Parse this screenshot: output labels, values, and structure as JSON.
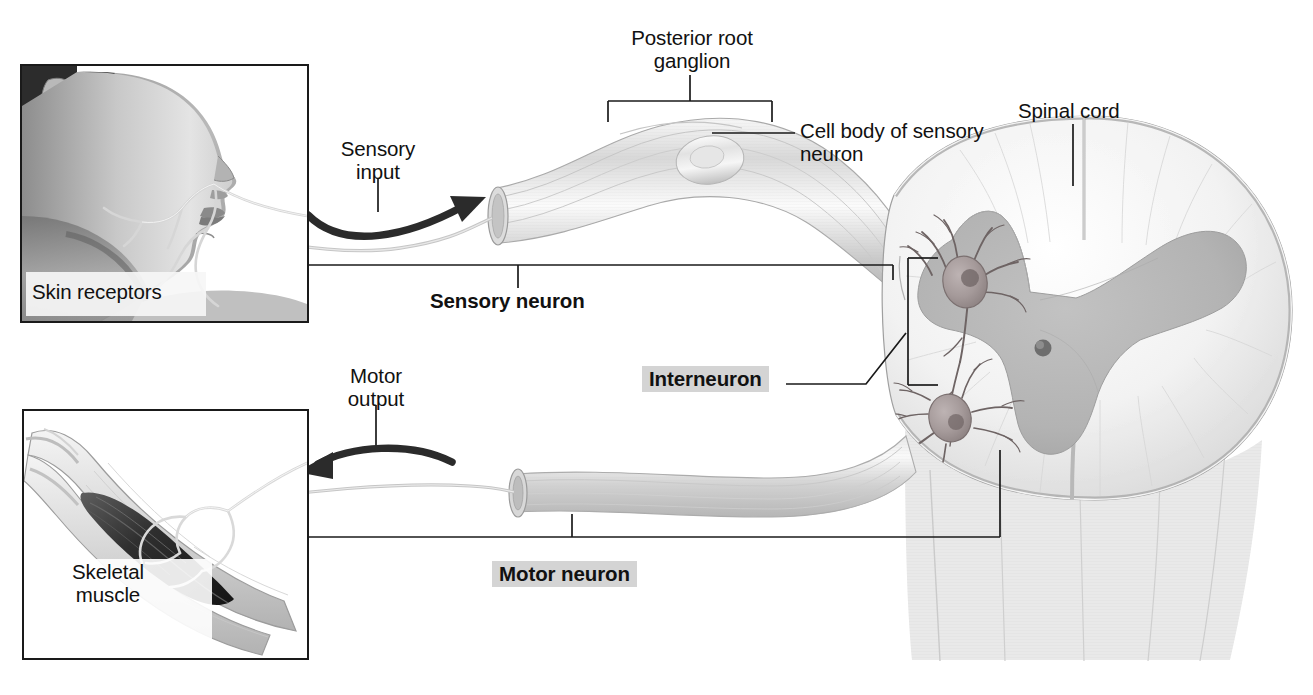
{
  "figure": {
    "kind": "anatomical-diagram",
    "background_color": "#ffffff",
    "text_color": "#111111",
    "highlight_color": "#d4d4d4",
    "gray_matter_color": "#b4b4b4",
    "white_matter_color": "#ececec",
    "nerve_color": "#c9c9c9",
    "arrow_color": "#2b2b2b",
    "leader_color": "#1a1a1a"
  },
  "labels": {
    "posterior_root_ganglion": "Posterior root\nganglion",
    "cell_body_of_sensory_neuron": "Cell body of sensory\nneuron",
    "spinal_cord": "Spinal cord",
    "sensory_input": "Sensory\ninput",
    "sensory_neuron": "Sensory neuron",
    "skin_receptors": "Skin receptors",
    "interneuron": "Interneuron",
    "motor_output": "Motor\noutput",
    "motor_neuron": "Motor neuron",
    "skeletal_muscle": "Skeletal\nmuscle"
  },
  "insets": {
    "skin": {
      "name": "skin-receptors-photo",
      "caption": "Skin receptors",
      "description": "Grayscale profile photograph of a woman's face and neck with nerve branches drawn onto the skin"
    },
    "muscle": {
      "name": "skeletal-muscle-illustration",
      "caption": "Skeletal muscle",
      "description": "Illustration of a flexed arm showing the skeletal muscle and its motor nerve branches"
    }
  },
  "arrows": [
    {
      "name": "sensory-input-arrow",
      "label": "Sensory input",
      "direction": "right"
    },
    {
      "name": "motor-output-arrow",
      "label": "Motor output",
      "direction": "left"
    }
  ],
  "structures": [
    {
      "name": "posterior-root-ganglion",
      "label": "Posterior root ganglion"
    },
    {
      "name": "sensory-neuron-cell-body",
      "label": "Cell body of sensory neuron"
    },
    {
      "name": "spinal-cord-cross-section",
      "label": "Spinal cord"
    },
    {
      "name": "interneuron-cell",
      "label": "Interneuron"
    },
    {
      "name": "motor-neuron-cell",
      "label": "Motor neuron"
    },
    {
      "name": "central-canal",
      "label": "Central canal"
    },
    {
      "name": "gray-matter",
      "label": "Gray matter"
    },
    {
      "name": "white-matter",
      "label": "White matter"
    }
  ]
}
